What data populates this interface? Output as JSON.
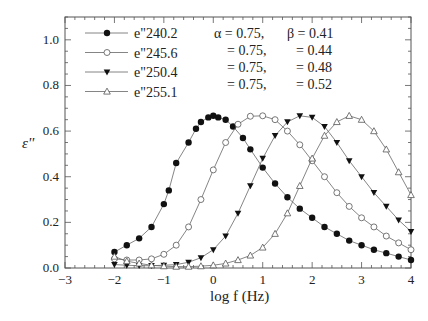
{
  "chart_data": {
    "type": "line",
    "title": "",
    "xlabel": "log f (Hz)",
    "ylabel": "ε''",
    "xlim": [
      -3,
      4
    ],
    "ylim": [
      0,
      1.1
    ],
    "xticks": [
      "-3",
      "-2",
      "-1",
      "0",
      "1",
      "2",
      "3",
      "4"
    ],
    "yticks": [
      "0.0",
      "0.2",
      "0.4",
      "0.6",
      "0.8",
      "1.0"
    ],
    "grid": false,
    "legend_position": "upper-left",
    "annotations": [
      {
        "alpha": "α = 0.75,",
        "beta": "β = 0.41"
      },
      {
        "alpha": "= 0.75,",
        "beta": "= 0.44"
      },
      {
        "alpha": "= 0.75,",
        "beta": "= 0.48"
      },
      {
        "alpha": "= 0.75,",
        "beta": "= 0.52"
      }
    ],
    "series": [
      {
        "name": "e\"240.2",
        "marker": "filled-circle",
        "peak_x": 0.0,
        "x": [
          -2.0,
          -1.75,
          -1.5,
          -1.25,
          -1.0,
          -0.9,
          -0.75,
          -0.5,
          -0.35,
          -0.25,
          -0.1,
          0.0,
          0.1,
          0.25,
          0.4,
          0.6,
          0.75,
          1.0,
          1.25,
          1.5,
          1.75,
          2.0,
          2.25,
          2.5,
          2.75,
          3.0,
          3.25,
          3.5,
          3.75,
          4.0
        ],
        "values": [
          0.07,
          0.1,
          0.13,
          0.18,
          0.28,
          0.34,
          0.46,
          0.55,
          0.61,
          0.64,
          0.66,
          0.667,
          0.66,
          0.65,
          0.62,
          0.57,
          0.52,
          0.44,
          0.37,
          0.31,
          0.26,
          0.22,
          0.18,
          0.15,
          0.12,
          0.1,
          0.08,
          0.065,
          0.05,
          0.035
        ]
      },
      {
        "name": "e\"245.6",
        "marker": "open-circle",
        "peak_x": 1.0,
        "x": [
          -2.0,
          -1.75,
          -1.5,
          -1.25,
          -1.0,
          -0.75,
          -0.5,
          -0.25,
          0.0,
          0.25,
          0.5,
          0.75,
          1.0,
          1.25,
          1.5,
          1.75,
          2.0,
          2.25,
          2.5,
          2.75,
          3.0,
          3.25,
          3.5,
          3.75,
          4.0
        ],
        "values": [
          0.04,
          0.035,
          0.035,
          0.04,
          0.06,
          0.1,
          0.18,
          0.3,
          0.43,
          0.55,
          0.63,
          0.665,
          0.667,
          0.65,
          0.6,
          0.54,
          0.47,
          0.4,
          0.33,
          0.27,
          0.22,
          0.18,
          0.14,
          0.11,
          0.08
        ]
      },
      {
        "name": "e\"250.4",
        "marker": "filled-triangle-down",
        "peak_x": 1.9,
        "x": [
          -2.0,
          -1.75,
          -1.5,
          -1.25,
          -1.0,
          -0.75,
          -0.5,
          -0.25,
          0.0,
          0.25,
          0.5,
          0.75,
          1.0,
          1.25,
          1.5,
          1.75,
          2.0,
          2.25,
          2.5,
          2.75,
          3.0,
          3.25,
          3.5,
          3.75,
          4.0
        ],
        "values": [
          0.015,
          0.012,
          0.01,
          0.01,
          0.012,
          0.015,
          0.025,
          0.045,
          0.08,
          0.14,
          0.24,
          0.36,
          0.48,
          0.58,
          0.64,
          0.667,
          0.66,
          0.62,
          0.55,
          0.47,
          0.4,
          0.33,
          0.27,
          0.21,
          0.16
        ]
      },
      {
        "name": "e\"255.1",
        "marker": "open-triangle-up",
        "peak_x": 2.75,
        "x": [
          -2.0,
          -1.75,
          -1.5,
          -1.25,
          -1.0,
          -0.75,
          -0.5,
          -0.25,
          0.0,
          0.25,
          0.5,
          0.75,
          1.0,
          1.25,
          1.5,
          1.75,
          2.0,
          2.25,
          2.5,
          2.75,
          3.0,
          3.25,
          3.5,
          3.75,
          4.0
        ],
        "values": [
          0.05,
          0.03,
          0.02,
          0.012,
          0.008,
          0.006,
          0.006,
          0.008,
          0.012,
          0.02,
          0.035,
          0.055,
          0.09,
          0.15,
          0.24,
          0.36,
          0.48,
          0.58,
          0.64,
          0.667,
          0.65,
          0.6,
          0.52,
          0.42,
          0.32
        ]
      }
    ]
  }
}
